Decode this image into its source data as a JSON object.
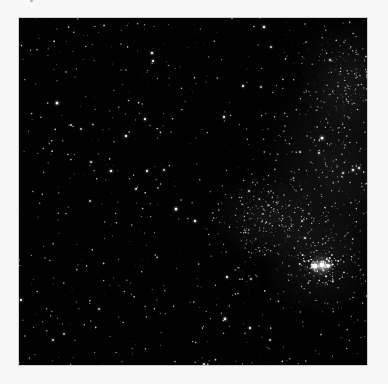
{
  "image": {
    "subject": "Star field with dense star cloud and bright double cluster",
    "background_color": "#f7f7f7",
    "field_color": "#020202",
    "field": {
      "x": 19,
      "y": 18,
      "width": 348,
      "height": 347
    }
  },
  "starfield": {
    "random_stars": {
      "seed": 1337,
      "uniform_count": 700,
      "cloud_count": 900,
      "cloud_regions": [
        {
          "cx": 315,
          "cy": 150,
          "rx": 55,
          "ry": 80
        },
        {
          "cx": 330,
          "cy": 60,
          "rx": 40,
          "ry": 45
        },
        {
          "cx": 300,
          "cy": 245,
          "rx": 45,
          "ry": 40
        },
        {
          "cx": 250,
          "cy": 200,
          "rx": 45,
          "ry": 35
        }
      ]
    },
    "bright_stars": [
      {
        "x": 38,
        "y": 85,
        "r": 1.5,
        "o": 0.95
      },
      {
        "x": 133,
        "y": 35,
        "r": 1.3,
        "o": 0.9
      },
      {
        "x": 134,
        "y": 43,
        "r": 1.2,
        "o": 0.85
      },
      {
        "x": 107,
        "y": 118,
        "r": 1.3,
        "o": 0.9
      },
      {
        "x": 126,
        "y": 101,
        "r": 1.2,
        "o": 0.85
      },
      {
        "x": 92,
        "y": 153,
        "r": 1.3,
        "o": 0.9
      },
      {
        "x": 128,
        "y": 153,
        "r": 1.2,
        "o": 0.85
      },
      {
        "x": 145,
        "y": 152,
        "r": 1.1,
        "o": 0.8
      },
      {
        "x": 72,
        "y": 144,
        "r": 1.1,
        "o": 0.8
      },
      {
        "x": 52,
        "y": 107,
        "r": 1.0,
        "o": 0.75
      },
      {
        "x": 62,
        "y": 111,
        "r": 1.0,
        "o": 0.75
      },
      {
        "x": 157,
        "y": 191,
        "r": 1.5,
        "o": 0.95
      },
      {
        "x": 176,
        "y": 203,
        "r": 1.3,
        "o": 0.9
      },
      {
        "x": 71,
        "y": 183,
        "r": 1.0,
        "o": 0.75
      },
      {
        "x": 117,
        "y": 171,
        "r": 1.1,
        "o": 0.8
      },
      {
        "x": 245,
        "y": 9,
        "r": 1.3,
        "o": 0.9
      },
      {
        "x": 252,
        "y": 29,
        "r": 1.1,
        "o": 0.8
      },
      {
        "x": 224,
        "y": 68,
        "r": 1.2,
        "o": 0.85
      },
      {
        "x": 242,
        "y": 69,
        "r": 1.0,
        "o": 0.75
      },
      {
        "x": 311,
        "y": 42,
        "r": 1.1,
        "o": 0.8
      },
      {
        "x": 205,
        "y": 99,
        "r": 1.2,
        "o": 0.85
      },
      {
        "x": 303,
        "y": 120,
        "r": 1.6,
        "o": 0.95
      },
      {
        "x": 300,
        "y": 135,
        "r": 1.1,
        "o": 0.8
      },
      {
        "x": 334,
        "y": 152,
        "r": 1.3,
        "o": 0.85
      },
      {
        "x": 340,
        "y": 150,
        "r": 1.2,
        "o": 0.8
      },
      {
        "x": 324,
        "y": 155,
        "r": 1.1,
        "o": 0.8
      },
      {
        "x": 281,
        "y": 134,
        "r": 1.0,
        "o": 0.75
      },
      {
        "x": 230,
        "y": 173,
        "r": 1.0,
        "o": 0.75
      },
      {
        "x": 283,
        "y": 203,
        "r": 1.0,
        "o": 0.75
      },
      {
        "x": 208,
        "y": 259,
        "r": 1.2,
        "o": 0.85
      },
      {
        "x": 232,
        "y": 261,
        "r": 1.0,
        "o": 0.75
      },
      {
        "x": 206,
        "y": 301,
        "r": 1.4,
        "o": 0.9
      },
      {
        "x": 231,
        "y": 310,
        "r": 1.2,
        "o": 0.85
      },
      {
        "x": 251,
        "y": 322,
        "r": 1.0,
        "o": 0.75
      },
      {
        "x": 286,
        "y": 220,
        "r": 1.1,
        "o": 0.8
      },
      {
        "x": 34,
        "y": 322,
        "r": 1.1,
        "o": 0.8
      },
      {
        "x": 45,
        "y": 316,
        "r": 1.0,
        "o": 0.75
      },
      {
        "x": 2,
        "y": 282,
        "r": 1.2,
        "o": 0.85
      },
      {
        "x": 80,
        "y": 291,
        "r": 1.0,
        "o": 0.75
      },
      {
        "x": 185,
        "y": 346,
        "r": 1.1,
        "o": 0.8
      }
    ],
    "cluster": {
      "cx": 302,
      "cy": 248,
      "cores": [
        {
          "x": 296,
          "y": 248,
          "r": 2.6,
          "o": 1.0
        },
        {
          "x": 303,
          "y": 247,
          "r": 2.4,
          "o": 1.0
        },
        {
          "x": 309,
          "y": 248,
          "r": 2.0,
          "o": 0.95
        }
      ],
      "halo_radius": 12,
      "halo_color": "#ffffff",
      "member_count": 70
    },
    "star_color": "#ffffff"
  }
}
